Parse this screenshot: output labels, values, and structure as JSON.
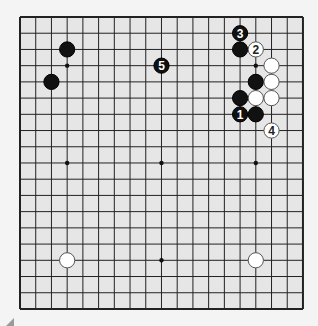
{
  "board": {
    "size": 19,
    "origin": {
      "x": 20,
      "y": 17
    },
    "spacing": {
      "x": 15.72,
      "y": 16.22
    },
    "background": "#e6e6e6",
    "line_color": "#222222",
    "star_points": [
      [
        3,
        3
      ],
      [
        9,
        3
      ],
      [
        15,
        3
      ],
      [
        3,
        9
      ],
      [
        9,
        9
      ],
      [
        15,
        9
      ],
      [
        3,
        15
      ],
      [
        9,
        15
      ],
      [
        15,
        15
      ]
    ]
  },
  "stones": [
    {
      "color": "black",
      "col": 3,
      "row": 2,
      "label": ""
    },
    {
      "color": "black",
      "col": 2,
      "row": 4,
      "label": ""
    },
    {
      "color": "black",
      "col": 9,
      "row": 3,
      "label": "5"
    },
    {
      "color": "black",
      "col": 14,
      "row": 1,
      "label": "3"
    },
    {
      "color": "black",
      "col": 14,
      "row": 2,
      "label": ""
    },
    {
      "color": "white",
      "col": 15,
      "row": 2,
      "label": "2"
    },
    {
      "color": "white",
      "col": 16,
      "row": 3,
      "label": ""
    },
    {
      "color": "black",
      "col": 15,
      "row": 4,
      "label": ""
    },
    {
      "color": "white",
      "col": 16,
      "row": 4,
      "label": ""
    },
    {
      "color": "black",
      "col": 14,
      "row": 5,
      "label": ""
    },
    {
      "color": "white",
      "col": 15,
      "row": 5,
      "label": ""
    },
    {
      "color": "white",
      "col": 16,
      "row": 5,
      "label": ""
    },
    {
      "color": "black",
      "col": 14,
      "row": 6,
      "label": "1"
    },
    {
      "color": "black",
      "col": 15,
      "row": 6,
      "label": ""
    },
    {
      "color": "white",
      "col": 16,
      "row": 7,
      "label": "4"
    },
    {
      "color": "white",
      "col": 3,
      "row": 15,
      "label": ""
    },
    {
      "color": "white",
      "col": 15,
      "row": 15,
      "label": ""
    }
  ]
}
